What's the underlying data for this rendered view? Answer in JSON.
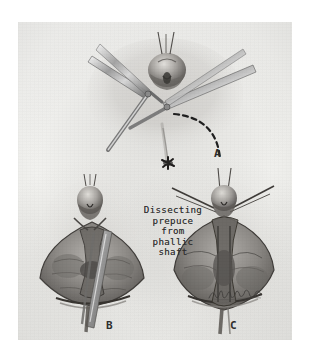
{
  "figure": {
    "medium": "pencil-and-charcoal-medical-illustration",
    "background_color": "#ffffff",
    "paper_color": "#f1f1ee",
    "ink_color": "#2b2b2b",
    "caption": {
      "lines": [
        "Dissecting",
        "prepuce",
        "from",
        "phallic",
        "shaft"
      ],
      "full_text": "Dissecting prepuce from phallic shaft"
    },
    "panels": [
      {
        "label": "A",
        "description": "Top panel: surgical field held with two pairs of forceps, dashed curved incision line marked to the right."
      },
      {
        "label": "B",
        "description": "Lower-left panel: dissected tissue flaps retracted open with a straight instrument in the midline."
      },
      {
        "label": "C",
        "description": "Lower-right panel: tissue flaps held apart by traction sutures with artist signature at lower right."
      }
    ],
    "signature": {
      "present": true,
      "legible": false,
      "description": "cursive artist signature"
    }
  }
}
